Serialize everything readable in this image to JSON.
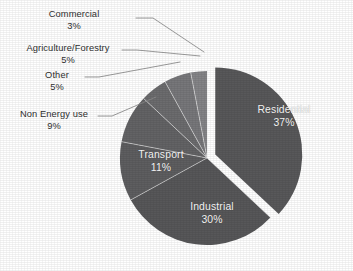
{
  "chart_data": {
    "type": "pie",
    "title": "",
    "subtitle": "",
    "xlabel": "",
    "ylabel": "",
    "legend_position": "none",
    "grid": false,
    "units": "%",
    "categories": [
      "Residential",
      "Industrial",
      "Transport",
      "Non Energy use",
      "Other",
      "Agriculture/Forestry",
      "Commercial"
    ],
    "values": [
      37,
      30,
      11,
      9,
      5,
      5,
      3
    ],
    "slices": [
      {
        "label": "Residential",
        "percent_text": "37%",
        "value": 37,
        "color": "#58585a",
        "label_placement": "inside",
        "exploded": true,
        "label_x": 283,
        "label_y": 111
      },
      {
        "label": "Industrial",
        "percent_text": "30%",
        "value": 30,
        "color": "#575759",
        "label_placement": "inside",
        "exploded": false,
        "label_x": 212,
        "label_y": 207
      },
      {
        "label": "Transport",
        "percent_text": "11%",
        "value": 11,
        "color": "#5e5e60",
        "label_placement": "inside",
        "exploded": false,
        "label_x": 161,
        "label_y": 155
      },
      {
        "label": "Non Energy use",
        "percent_text": "9%",
        "value": 9,
        "color": "#636365",
        "label_placement": "callout",
        "exploded": false,
        "label_x": 18,
        "label_y": 110
      },
      {
        "label": "Other",
        "percent_text": "5%",
        "value": 5,
        "color": "#6c6c6e",
        "label_placement": "callout",
        "exploded": false,
        "label_x": 50,
        "label_y": 71
      },
      {
        "label": "Agriculture/Forestry",
        "percent_text": "5%",
        "value": 5,
        "color": "#77777a",
        "label_placement": "callout",
        "exploded": false,
        "label_x": 22,
        "label_y": 43
      },
      {
        "label": "Commercial",
        "percent_text": "3%",
        "value": 3,
        "color": "#848487",
        "label_placement": "callout",
        "exploded": false,
        "label_x": 73,
        "label_y": 9
      }
    ],
    "colors": {
      "background": "#ffffff",
      "callout_text": "#2e2e2e",
      "inside_text": "#f2f2f2",
      "leader_line": "#8a8a8a"
    },
    "geometry": {
      "center_x": 207,
      "center_y": 158,
      "radius": 87,
      "explode_offset": 9,
      "start_angle_deg": -90
    }
  }
}
